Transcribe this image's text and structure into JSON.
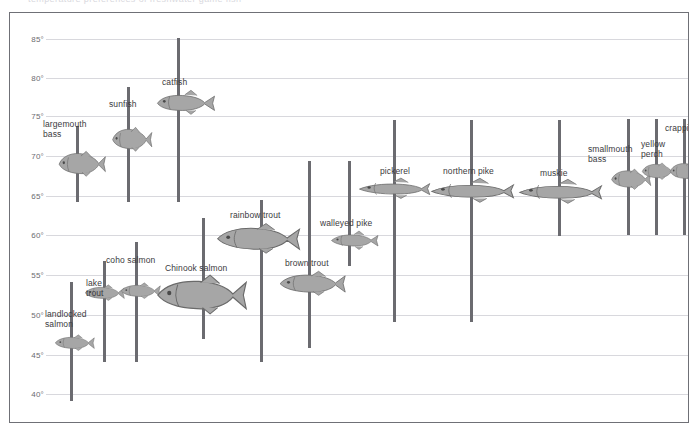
{
  "page": {
    "top_ghost_text": "temperature preferences of freshwater game fish"
  },
  "chart_data": {
    "type": "bar",
    "title": "",
    "subtitle": "",
    "xlabel": "",
    "ylabel": "",
    "ylim": [
      40,
      85
    ],
    "ytick_labels": [
      "85°",
      "80°",
      "75°",
      "70°",
      "65°",
      "60°",
      "55°",
      "50°",
      "45°",
      "40°"
    ],
    "ytick_values": [
      85,
      80,
      75,
      70,
      65,
      60,
      55,
      50,
      45,
      40
    ],
    "grid": true,
    "legend": "none",
    "orientation": "vertical-range-bars",
    "categories": [
      "largemouth bass",
      "sunfish",
      "catfish",
      "landlocked salmon",
      "lake trout",
      "coho salmon",
      "Chinook salmon",
      "rainbow trout",
      "brown trout",
      "walleyed pike",
      "pickerel",
      "northern pike",
      "muskie",
      "smallmouth bass",
      "yellow perch",
      "crappie"
    ],
    "series": [
      {
        "name": "preferred temperature range (°F)",
        "ranges": [
          {
            "category": "largemouth bass",
            "low": 65.0,
            "high": 75.0
          },
          {
            "category": "sunfish",
            "low": 65.0,
            "high": 80.0
          },
          {
            "category": "catfish",
            "low": 65.0,
            "high": 85.0
          },
          {
            "category": "landlocked salmon",
            "low": 40.0,
            "high": 55.0
          },
          {
            "category": "lake trout",
            "low": 45.0,
            "high": 57.5
          },
          {
            "category": "coho salmon",
            "low": 45.0,
            "high": 60.0
          },
          {
            "category": "Chinook salmon",
            "low": 48.0,
            "high": 63.0
          },
          {
            "category": "rainbow trout",
            "low": 50.0,
            "high": 65.0
          },
          {
            "category": "brown trout",
            "low": 46.5,
            "high": 70.0
          },
          {
            "category": "walleyed pike",
            "low": 57.0,
            "high": 70.0
          },
          {
            "category": "pickerel",
            "low": 50.0,
            "high": 75.0
          },
          {
            "category": "northern pike",
            "low": 50.0,
            "high": 75.0
          },
          {
            "category": "muskie",
            "low": 61.0,
            "high": 75.0
          },
          {
            "category": "smallmouth bass",
            "low": 61.0,
            "high": 76.0
          },
          {
            "category": "yellow perch",
            "low": 61.0,
            "high": 76.0
          },
          {
            "category": "crappie",
            "low": 61.0,
            "high": 76.0
          }
        ]
      }
    ],
    "labels": [
      {
        "text": "largemouth\nbass",
        "category": "largemouth bass"
      },
      {
        "text": "sunfish",
        "category": "sunfish"
      },
      {
        "text": "catfish",
        "category": "catfish"
      },
      {
        "text": "landlocked\nsalmon",
        "category": "landlocked salmon"
      },
      {
        "text": "lake\ntrout",
        "category": "lake trout"
      },
      {
        "text": "coho salmon",
        "category": "coho salmon"
      },
      {
        "text": "Chinook salmon",
        "category": "Chinook salmon"
      },
      {
        "text": "rainbow trout",
        "category": "rainbow trout"
      },
      {
        "text": "brown trout",
        "category": "brown trout"
      },
      {
        "text": "walleyed pike",
        "category": "walleyed pike"
      },
      {
        "text": "pickerel",
        "category": "pickerel"
      },
      {
        "text": "northern pike",
        "category": "northern pike"
      },
      {
        "text": "muskie",
        "category": "muskie"
      },
      {
        "text": "smallmouth\nbass",
        "category": "smallmouth bass"
      },
      {
        "text": "yellow\nperch",
        "category": "yellow perch"
      },
      {
        "text": "crappie",
        "category": "crappie"
      }
    ],
    "colors": {
      "bar": "#6b6b70",
      "grid": "#d8d8dd",
      "fish_fill": "#a6a6a6",
      "fish_stroke": "#6a6a6a",
      "text": "#3b3b40",
      "frame": "#6f7076"
    }
  },
  "layout": {
    "bars_px": [
      {
        "name": "largemouth bass",
        "x": 66,
        "top": 125,
        "bottom": 201,
        "label_x": 33,
        "label_y": 118,
        "fish_x": 46,
        "fish_y": 149,
        "fish_w": 52,
        "fish_h": 27,
        "fish_shape": "bass"
      },
      {
        "name": "sunfish",
        "x": 117,
        "top": 86,
        "bottom": 201,
        "label_x": 99,
        "label_y": 98,
        "fish_x": 100,
        "fish_y": 125,
        "fish_w": 44,
        "fish_h": 26,
        "fish_shape": "sunfish"
      },
      {
        "name": "catfish",
        "x": 167,
        "top": 37,
        "bottom": 201,
        "label_x": 152,
        "label_y": 76,
        "fish_x": 145,
        "fish_y": 88,
        "fish_w": 62,
        "fish_h": 26,
        "fish_shape": "catfish"
      },
      {
        "name": "landlocked salmon",
        "x": 60,
        "top": 281,
        "bottom": 400,
        "label_x": 35,
        "label_y": 308,
        "fish_x": 44,
        "fish_y": 333,
        "fish_w": 42,
        "fish_h": 17,
        "fish_shape": "salmon"
      },
      {
        "name": "lake trout",
        "x": 93,
        "top": 260,
        "bottom": 361,
        "label_x": 76,
        "label_y": 277,
        "fish_x": 74,
        "fish_y": 283,
        "fish_w": 42,
        "fish_h": 17,
        "fish_shape": "trout"
      },
      {
        "name": "coho salmon",
        "x": 125,
        "top": 241,
        "bottom": 361,
        "label_x": 96,
        "label_y": 254,
        "fish_x": 110,
        "fish_y": 281,
        "fish_w": 42,
        "fish_h": 17,
        "fish_shape": "salmon"
      },
      {
        "name": "Chinook salmon",
        "x": 192,
        "top": 217,
        "bottom": 338,
        "label_x": 155,
        "label_y": 262,
        "fish_x": 145,
        "fish_y": 272,
        "fish_w": 95,
        "fish_h": 42,
        "fish_shape": "chinook"
      },
      {
        "name": "rainbow trout",
        "x": 250,
        "top": 199,
        "bottom": 361,
        "label_x": 220,
        "label_y": 209,
        "fish_x": 205,
        "fish_y": 221,
        "fish_w": 88,
        "fish_h": 32,
        "fish_shape": "rainbow"
      },
      {
        "name": "brown trout",
        "x": 298,
        "top": 160,
        "bottom": 347,
        "label_x": 275,
        "label_y": 257,
        "fish_x": 268,
        "fish_y": 269,
        "fish_w": 70,
        "fish_h": 26,
        "fish_shape": "browntrout"
      },
      {
        "name": "walleyed pike",
        "x": 338,
        "top": 160,
        "bottom": 265,
        "label_x": 310,
        "label_y": 217,
        "fish_x": 320,
        "fish_y": 229,
        "fish_w": 50,
        "fish_h": 20,
        "fish_shape": "walleye"
      },
      {
        "name": "pickerel",
        "x": 383,
        "top": 119,
        "bottom": 321,
        "label_x": 370,
        "label_y": 165,
        "fish_x": 348,
        "fish_y": 176,
        "fish_w": 74,
        "fish_h": 22,
        "fish_shape": "pike"
      },
      {
        "name": "northern pike",
        "x": 460,
        "top": 119,
        "bottom": 321,
        "label_x": 433,
        "label_y": 165,
        "fish_x": 420,
        "fish_y": 176,
        "fish_w": 86,
        "fish_h": 26,
        "fish_shape": "pike"
      },
      {
        "name": "muskie",
        "x": 548,
        "top": 119,
        "bottom": 235,
        "label_x": 530,
        "label_y": 167,
        "fish_x": 508,
        "fish_y": 177,
        "fish_w": 86,
        "fish_h": 26,
        "fish_shape": "pike"
      },
      {
        "name": "smallmouth bass",
        "x": 617,
        "top": 118,
        "bottom": 234,
        "label_x": 578,
        "label_y": 143,
        "fish_x": 599,
        "fish_y": 167,
        "fish_w": 44,
        "fish_h": 22,
        "fish_shape": "bass"
      },
      {
        "name": "yellow perch",
        "x": 645,
        "top": 118,
        "bottom": 234,
        "label_x": 631,
        "label_y": 138,
        "fish_x": 630,
        "fish_y": 161,
        "fish_w": 38,
        "fish_h": 18,
        "fish_shape": "perch"
      },
      {
        "name": "crappie",
        "x": 673,
        "top": 118,
        "bottom": 234,
        "label_x": 655,
        "label_y": 122,
        "fish_x": 658,
        "fish_y": 160,
        "fish_w": 38,
        "fish_h": 20,
        "fish_shape": "crappie"
      }
    ],
    "gridlines_px": [
      38,
      77,
      115,
      155,
      195,
      234,
      274,
      314,
      354,
      393
    ]
  }
}
